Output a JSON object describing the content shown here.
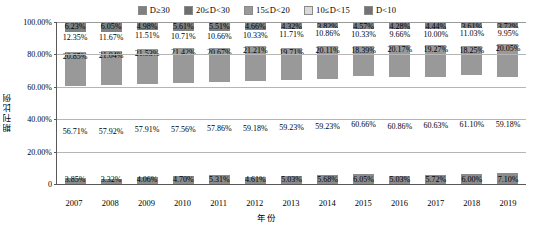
{
  "chart_data": {
    "type": "bar",
    "subtype": "stacked-100-percent",
    "title": "",
    "xlabel": "年份",
    "ylabel": "期刊比例",
    "ylim": [
      0,
      100
    ],
    "yticks": [
      "0.00%",
      "20.00%",
      "40.00%",
      "60.00%",
      "80.00%",
      "100.00%"
    ],
    "grid": true,
    "legend_position": "top",
    "categories": [
      "2007",
      "2008",
      "2009",
      "2010",
      "2011",
      "2012",
      "2013",
      "2014",
      "2015",
      "2016",
      "2017",
      "2018",
      "2019"
    ],
    "series": [
      {
        "name": "D≥30",
        "color": "#808080",
        "values": [
          6.23,
          6.05,
          4.98,
          5.61,
          5.51,
          4.66,
          4.32,
          3.82,
          4.57,
          4.28,
          4.44,
          3.61,
          3.72
        ],
        "labels": [
          "6.23%",
          "6.05%",
          "4.98%",
          "5.61%",
          "5.51%",
          "4.66%",
          "4.32%",
          "3.82%",
          "4.57%",
          "4.28%",
          "4.44%",
          "3.61%",
          "3.72%"
        ]
      },
      {
        "name": "20≤D<30",
        "color": "#ffffff",
        "values": [
          12.35,
          11.67,
          11.51,
          10.71,
          10.66,
          10.33,
          11.71,
          10.86,
          10.33,
          9.66,
          10.0,
          11.03,
          9.95
        ],
        "labels": [
          "12.35%",
          "11.67%",
          "11.51%",
          "10.71%",
          "10.66%",
          "10.33%",
          "11.71%",
          "10.86%",
          "10.33%",
          "9.66%",
          "10.00%",
          "11.03%",
          "9.95%"
        ]
      },
      {
        "name": "15≤D<20",
        "color": "#999999",
        "values": [
          20.85,
          21.04,
          21.53,
          21.42,
          20.67,
          21.21,
          19.71,
          20.11,
          18.39,
          20.17,
          19.27,
          18.25,
          20.05
        ],
        "labels": [
          "20.85%",
          "21.04%",
          "21.53%",
          "21.42%",
          "20.67%",
          "21.21%",
          "19.71%",
          "20.11%",
          "18.39%",
          "20.17%",
          "19.27%",
          "18.25%",
          "20.05%"
        ]
      },
      {
        "name": "10≤D<15",
        "color": "#ffffff",
        "values": [
          56.71,
          57.92,
          57.91,
          57.56,
          57.86,
          59.18,
          59.23,
          59.23,
          60.66,
          60.86,
          60.63,
          61.1,
          59.18
        ],
        "labels": [
          "56.71%",
          "57.92%",
          "57.91%",
          "57.56%",
          "57.86%",
          "59.18%",
          "59.23%",
          "59.23%",
          "60.66%",
          "60.86%",
          "60.63%",
          "61.10%",
          "59.18%"
        ]
      },
      {
        "name": "D<10",
        "color": "#8c8c8c",
        "values": [
          3.85,
          3.32,
          4.06,
          4.7,
          5.31,
          4.61,
          5.03,
          5.68,
          6.05,
          5.03,
          5.72,
          6.0,
          7.1
        ],
        "labels": [
          "3.85%",
          "3.32%",
          "4.06%",
          "4.70%",
          "5.31%",
          "4.61%",
          "5.03%",
          "5.68%",
          "6.05%",
          "5.03%",
          "5.72%",
          "6.00%",
          "7.10%"
        ]
      }
    ]
  },
  "legend": {
    "items": [
      {
        "label": "D≥30",
        "swatch": "#808080"
      },
      {
        "label": "20≤D<30",
        "swatch": "#6e6e6e"
      },
      {
        "label": "15≤D<20",
        "swatch": "#999999"
      },
      {
        "label": "10≤D<15",
        "swatch": "#d9d9d9"
      },
      {
        "label": "D<10",
        "swatch": "#737373"
      }
    ]
  },
  "axes": {
    "y_title": "期刊比例",
    "x_title": "年份",
    "y_ticks": [
      "100.00%",
      "80.00%",
      "60.00%",
      "40.00%",
      "20.00%",
      "0"
    ]
  }
}
